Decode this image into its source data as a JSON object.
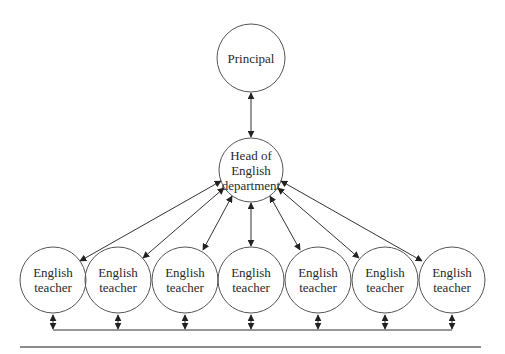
{
  "diagram": {
    "type": "organizational-chart",
    "nodes": {
      "principal": {
        "lines": [
          "Principal"
        ]
      },
      "head": {
        "lines": [
          "Head of",
          "English",
          "department"
        ]
      },
      "teachers": [
        {
          "lines": [
            "English",
            "teacher"
          ]
        },
        {
          "lines": [
            "English",
            "teacher"
          ]
        },
        {
          "lines": [
            "English",
            "teacher"
          ]
        },
        {
          "lines": [
            "English",
            "teacher"
          ]
        },
        {
          "lines": [
            "English",
            "teacher"
          ]
        },
        {
          "lines": [
            "English",
            "teacher"
          ]
        },
        {
          "lines": [
            "English",
            "teacher"
          ]
        }
      ]
    },
    "edges": [
      {
        "from": "principal",
        "to": "head",
        "style": "bidirectional-arrow"
      },
      {
        "from": "head",
        "to": "teacher-1",
        "style": "bidirectional-arrow"
      },
      {
        "from": "head",
        "to": "teacher-2",
        "style": "bidirectional-arrow"
      },
      {
        "from": "head",
        "to": "teacher-3",
        "style": "bidirectional-arrow"
      },
      {
        "from": "head",
        "to": "teacher-4",
        "style": "bidirectional-arrow"
      },
      {
        "from": "head",
        "to": "teacher-5",
        "style": "bidirectional-arrow"
      },
      {
        "from": "head",
        "to": "teacher-6",
        "style": "bidirectional-arrow"
      },
      {
        "from": "head",
        "to": "teacher-7",
        "style": "bidirectional-arrow"
      },
      {
        "from": "teachers",
        "to": "teacher-bus",
        "style": "bidirectional-arrow-to-shared-line"
      }
    ],
    "colors": {
      "stroke": "#3a3a3a",
      "text": "#2a2a2a",
      "background": "#ffffff"
    }
  }
}
